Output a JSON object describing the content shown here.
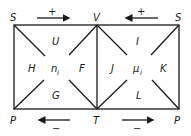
{
  "diagram": {
    "type": "thermodynamic-square",
    "corners": {
      "top_left": "S",
      "top_mid": "V",
      "top_right": "S",
      "bottom_left": "P",
      "bottom_mid": "T",
      "bottom_right": "P"
    },
    "left_square": {
      "top": "U",
      "left": "H",
      "center": "n",
      "center_sub": "i",
      "right": "F",
      "bottom": "G"
    },
    "right_square": {
      "top": "I",
      "left": "J",
      "center": "μ",
      "center_sub": "i",
      "right": "K",
      "bottom": "L"
    },
    "arrows": {
      "top_left": {
        "sign": "+",
        "direction": "right"
      },
      "top_right": {
        "sign": "+",
        "direction": "left"
      },
      "bottom_left": {
        "sign": "−",
        "direction": "left"
      },
      "bottom_right": {
        "sign": "−",
        "direction": "right"
      }
    },
    "colors": {
      "ink": "#1a1a1a",
      "background": "#ffffff"
    }
  }
}
